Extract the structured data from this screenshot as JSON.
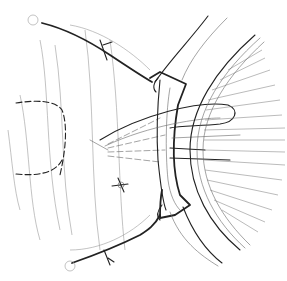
{
  "figure": {
    "colors": {
      "background": "#ffffff",
      "ink": "#222222",
      "light_ink": "#9a9a9a"
    }
  }
}
